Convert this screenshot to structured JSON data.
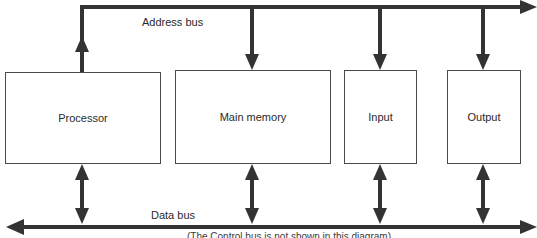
{
  "diagram": {
    "type": "block-diagram",
    "buses": {
      "address": {
        "label": "Address bus",
        "direction": "right"
      },
      "data": {
        "label": "Data bus",
        "direction": "bidirectional"
      }
    },
    "components": [
      {
        "id": "processor",
        "label": "Processor",
        "address_arrow": "up",
        "data_arrow": "both"
      },
      {
        "id": "main-memory",
        "label": "Main memory",
        "address_arrow": "down",
        "data_arrow": "both"
      },
      {
        "id": "input",
        "label": "Input",
        "address_arrow": "down",
        "data_arrow": "both"
      },
      {
        "id": "output",
        "label": "Output",
        "address_arrow": "down",
        "data_arrow": "both"
      }
    ],
    "footnote": "(The Control bus is not shown in this diagram)",
    "colors": {
      "line": "#333333",
      "box_border": "#4a4a4a",
      "text": "#2a2a2a"
    }
  }
}
